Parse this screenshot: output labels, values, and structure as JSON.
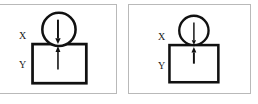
{
  "figure": {
    "panel_background": "#ffffff",
    "panel_border_color": "#b9b9b9",
    "stroke_color": "#111111",
    "page_background": "#ffffff"
  },
  "panels": [
    {
      "id": "panel-left",
      "name": "left-diagram-panel",
      "labels": {
        "upper": "X",
        "lower": "Y"
      },
      "shapes": {
        "circle": {
          "name": "circle-body-x",
          "cx": 63,
          "cy": 25,
          "r": 17,
          "stroke_width": 2.6,
          "fill": "#ffffff"
        },
        "square": {
          "name": "square-body-y",
          "x": 36,
          "y": 40,
          "width": 55,
          "height": 40,
          "stroke_width": 2.8,
          "fill": "#ffffff"
        }
      },
      "arrows": [
        {
          "name": "force-arrow-down",
          "direction": "down",
          "x": 62,
          "y_start": 15,
          "y_end": 40,
          "stroke_width": 2.0,
          "head_width": 5.5,
          "head_length": 6
        },
        {
          "name": "force-arrow-up",
          "direction": "up",
          "x": 62,
          "y_start": 66,
          "y_end": 42,
          "stroke_width": 1.6,
          "head_width": 5.0,
          "head_length": 6
        }
      ]
    },
    {
      "id": "panel-right",
      "name": "right-diagram-panel",
      "labels": {
        "upper": "X",
        "lower": "Y"
      },
      "shapes": {
        "circle": {
          "name": "circle-body-x",
          "cx": 66,
          "cy": 26,
          "r": 15,
          "stroke_width": 2.4,
          "fill": "#ffffff"
        },
        "square": {
          "name": "square-body-y",
          "x": 41,
          "y": 41,
          "width": 50,
          "height": 38,
          "stroke_width": 2.6,
          "fill": "#ffffff"
        }
      },
      "arrows": [
        {
          "name": "force-arrow-down",
          "direction": "down",
          "x": 66,
          "y_start": 18,
          "y_end": 41,
          "stroke_width": 1.5,
          "head_width": 4.4,
          "head_length": 5
        },
        {
          "name": "force-arrow-up",
          "direction": "up",
          "x": 66,
          "y_start": 60,
          "y_end": 43,
          "stroke_width": 2.0,
          "head_width": 5.0,
          "head_length": 5.5
        }
      ]
    }
  ]
}
